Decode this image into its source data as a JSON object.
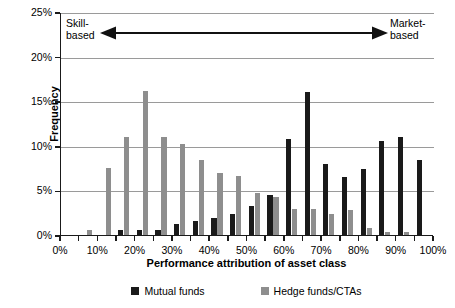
{
  "chart_data": {
    "type": "bar",
    "title": "",
    "xlabel": "Performance attribution of asset class",
    "ylabel": "Frequency",
    "categories": [
      "0%",
      "5%",
      "10%",
      "15%",
      "20%",
      "25%",
      "30%",
      "35%",
      "40%",
      "45%",
      "50%",
      "55%",
      "60%",
      "65%",
      "70%",
      "75%",
      "80%",
      "85%",
      "90%",
      "95%",
      "100%"
    ],
    "series": [
      {
        "name": "Mutual funds",
        "color": "#1a1a1a",
        "values": [
          0,
          0,
          0,
          0.6,
          0.6,
          0.6,
          1.2,
          1.6,
          1.9,
          2.4,
          3.2,
          4.5,
          10.8,
          16.0,
          8.0,
          6.5,
          7.4,
          10.5,
          11.0,
          8.4,
          0
        ]
      },
      {
        "name": "Hedge funds/CTAs",
        "color": "#8e8e8e",
        "values": [
          0,
          0.6,
          7.5,
          11.0,
          16.1,
          11.0,
          10.2,
          8.4,
          7.0,
          6.6,
          4.7,
          4.3,
          2.9,
          2.9,
          2.4,
          2.8,
          0.8,
          0.3,
          0.3,
          0,
          0
        ]
      }
    ],
    "xticks": [
      "0%",
      "10%",
      "20%",
      "30%",
      "40%",
      "50%",
      "60%",
      "70%",
      "80%",
      "90%",
      "100%"
    ],
    "yticks": [
      "0%",
      "5%",
      "10%",
      "15%",
      "20%",
      "25%"
    ],
    "ylim": [
      0,
      25
    ],
    "xlim": [
      0,
      100
    ],
    "grid": "horizontal",
    "legend_position": "bottom",
    "annotations": {
      "left_label": "Skill-\nbased",
      "left_label_line1": "Skill-",
      "left_label_line2": "based",
      "right_label_line1": "Market-",
      "right_label_line2": "based",
      "arrow": "double-headed-horizontal-arrow"
    }
  },
  "legend": {
    "items": [
      {
        "label": "Mutual funds",
        "color": "#1a1a1a"
      },
      {
        "label": "Hedge funds/CTAs",
        "color": "#8e8e8e"
      }
    ]
  },
  "axes": {
    "x_title": "Performance attribution of asset class",
    "y_title": "Frequency"
  }
}
